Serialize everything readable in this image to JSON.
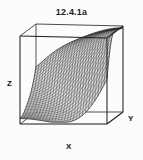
{
  "figure": {
    "title": "12.4.1a",
    "background_color": "#fdfdfd",
    "line_color": "#1a1a1a",
    "mesh_color": "#2b2b2b",
    "surface_fill": "#d8d8d8"
  },
  "axes": {
    "x_label": "X",
    "y_label": "Y",
    "z_label": "Z"
  },
  "chart_data": {
    "type": "line",
    "plot_kind": "3d-wireframe-surface",
    "title": "12.4.1a",
    "xlabel": "X",
    "ylabel": "Y",
    "zlabel": "Z",
    "grid": true,
    "legend": "none",
    "mesh_rows": 28,
    "mesh_cols": 28,
    "xlim": [
      0,
      1
    ],
    "ylim": [
      0,
      1
    ],
    "zlim": [
      0,
      1
    ],
    "surface_z": [
      [
        0.04,
        0.05,
        0.07,
        0.11,
        0.17,
        0.26,
        0.38,
        0.5,
        0.62,
        0.72,
        0.8,
        0.86,
        0.9,
        0.93
      ],
      [
        0.05,
        0.06,
        0.08,
        0.12,
        0.19,
        0.28,
        0.4,
        0.52,
        0.64,
        0.74,
        0.82,
        0.87,
        0.91,
        0.94
      ],
      [
        0.06,
        0.07,
        0.1,
        0.14,
        0.21,
        0.31,
        0.43,
        0.55,
        0.66,
        0.76,
        0.83,
        0.88,
        0.92,
        0.94
      ],
      [
        0.08,
        0.09,
        0.12,
        0.17,
        0.24,
        0.34,
        0.46,
        0.58,
        0.69,
        0.78,
        0.85,
        0.9,
        0.93,
        0.95
      ],
      [
        0.1,
        0.12,
        0.15,
        0.2,
        0.28,
        0.39,
        0.5,
        0.62,
        0.72,
        0.81,
        0.87,
        0.91,
        0.94,
        0.96
      ],
      [
        0.13,
        0.15,
        0.19,
        0.25,
        0.33,
        0.44,
        0.55,
        0.66,
        0.76,
        0.83,
        0.89,
        0.93,
        0.95,
        0.97
      ],
      [
        0.16,
        0.19,
        0.23,
        0.3,
        0.39,
        0.49,
        0.6,
        0.7,
        0.79,
        0.86,
        0.91,
        0.94,
        0.96,
        0.97
      ],
      [
        0.2,
        0.23,
        0.28,
        0.35,
        0.44,
        0.55,
        0.65,
        0.75,
        0.82,
        0.88,
        0.92,
        0.95,
        0.97,
        0.98
      ],
      [
        0.24,
        0.28,
        0.34,
        0.41,
        0.5,
        0.6,
        0.7,
        0.79,
        0.85,
        0.9,
        0.94,
        0.96,
        0.97,
        0.98
      ],
      [
        0.29,
        0.33,
        0.39,
        0.47,
        0.56,
        0.66,
        0.75,
        0.82,
        0.88,
        0.92,
        0.95,
        0.97,
        0.98,
        0.99
      ],
      [
        0.34,
        0.39,
        0.45,
        0.53,
        0.62,
        0.71,
        0.79,
        0.85,
        0.9,
        0.94,
        0.96,
        0.98,
        0.98,
        0.99
      ],
      [
        0.39,
        0.44,
        0.51,
        0.59,
        0.67,
        0.76,
        0.83,
        0.88,
        0.92,
        0.95,
        0.97,
        0.98,
        0.99,
        0.99
      ],
      [
        0.45,
        0.5,
        0.57,
        0.64,
        0.72,
        0.8,
        0.86,
        0.91,
        0.94,
        0.96,
        0.98,
        0.99,
        0.99,
        1.0
      ],
      [
        0.5,
        0.55,
        0.62,
        0.69,
        0.77,
        0.83,
        0.89,
        0.93,
        0.95,
        0.97,
        0.98,
        0.99,
        1.0,
        1.0
      ]
    ]
  }
}
